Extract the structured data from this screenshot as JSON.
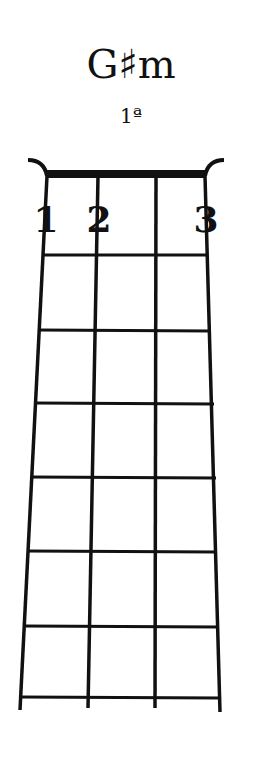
{
  "chord": {
    "name": "G♯m",
    "position": "1ª"
  },
  "diagram": {
    "strings": 4,
    "frets_shown": 7,
    "fingers": [
      {
        "label": "1",
        "string": 1
      },
      {
        "label": "2",
        "string": 2
      },
      {
        "label": "3",
        "string": 4
      }
    ]
  }
}
